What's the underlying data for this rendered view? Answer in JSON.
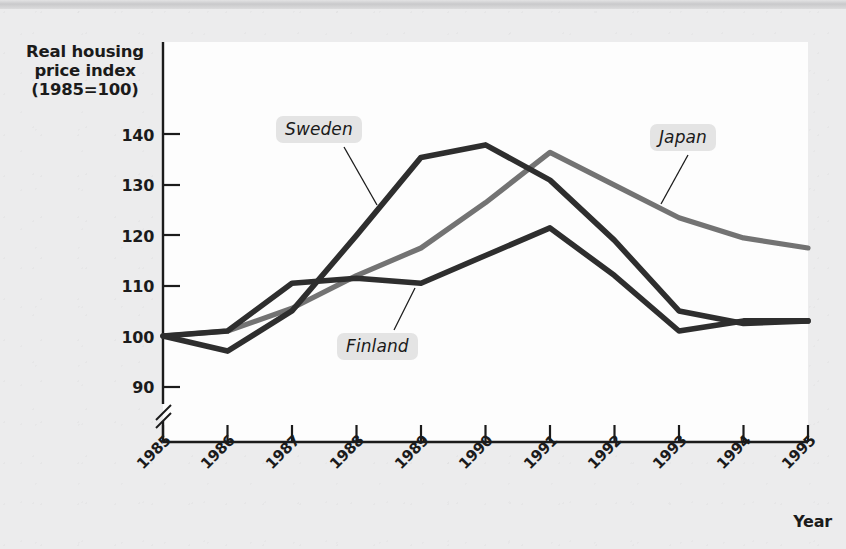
{
  "figure": {
    "y_axis_title": "Real housing\nprice index\n(1985=100)",
    "y_axis_title_lines": [
      "Real housing",
      "price index",
      "(1985=100)"
    ],
    "x_axis_title": "Year",
    "axis_break_note": "y-axis break below 90"
  },
  "labels": {
    "sweden": "Sweden",
    "japan": "Japan",
    "finland": "Finland"
  },
  "colors": {
    "sweden_line": "#2e2e2e",
    "finland_line": "#2e2e2e",
    "japan_line": "#737373",
    "axis": "#1b1b1b",
    "plot_background": "#fdfdfd",
    "page_background": "#ececed",
    "label_chip": "#e4e4e4"
  },
  "chart_data": {
    "type": "line",
    "title": "",
    "xlabel": "Year",
    "ylabel": "Real housing price index (1985=100)",
    "x": [
      "1985",
      "1986",
      "1987",
      "1988",
      "1989",
      "1990",
      "1991",
      "1992",
      "1993",
      "1994",
      "1995"
    ],
    "xlim": [
      "1985",
      "1995"
    ],
    "ylim": [
      85,
      145
    ],
    "yticks": [
      90,
      100,
      110,
      120,
      130,
      140
    ],
    "ytick_labels": [
      "90",
      "100",
      "110",
      "120",
      "130",
      "140"
    ],
    "grid": false,
    "legend": "inline-annotations",
    "axis_break": true,
    "series": [
      {
        "name": "Sweden",
        "color": "#2e2e2e",
        "values": [
          100,
          97,
          105,
          120,
          135.5,
          138,
          131,
          119,
          105,
          102.5,
          103
        ]
      },
      {
        "name": "Japan",
        "color": "#737373",
        "values": [
          100,
          101,
          105.5,
          112,
          117.5,
          126.5,
          136.5,
          130,
          123.5,
          119.5,
          117.5
        ]
      },
      {
        "name": "Finland",
        "color": "#2e2e2e",
        "values": [
          100,
          101,
          110.5,
          111.5,
          110.5,
          116,
          121.5,
          112,
          101,
          103,
          103
        ]
      }
    ],
    "annotations": [
      {
        "text": "Sweden",
        "target_series": "Sweden",
        "target_year": "1988"
      },
      {
        "text": "Japan",
        "target_series": "Japan",
        "target_year": "1992"
      },
      {
        "text": "Finland",
        "target_series": "Finland",
        "target_year": "1988"
      }
    ]
  }
}
